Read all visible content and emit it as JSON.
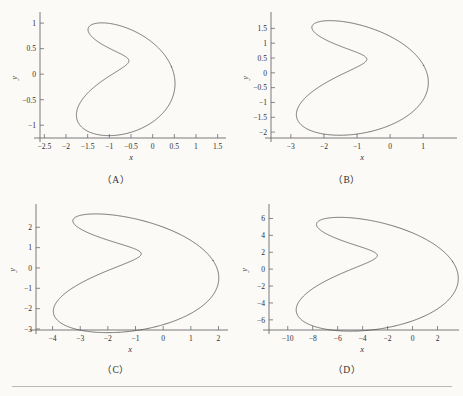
{
  "figure": {
    "background": "#fbfaf7",
    "curve_color": "#4a4a4a",
    "axis_color": "#6b6b6b",
    "rule_color": "#b9b9b9"
  },
  "panels": [
    {
      "id": "A",
      "caption": "（A）",
      "xlabel": "x",
      "ylabel": "y",
      "xticks": [
        "-2.5",
        "-2.0",
        "-1.5",
        "-1.0",
        "-0.5",
        "0.0",
        "0.5",
        "1.0",
        "1.5"
      ],
      "yticks": [
        "-1.0",
        "-0.5",
        "0.0",
        "0.5",
        "1.0"
      ]
    },
    {
      "id": "B",
      "caption": "（B）",
      "xlabel": "x",
      "ylabel": "y",
      "xticks": [
        "-3",
        "-2",
        "-1",
        "0",
        "1"
      ],
      "yticks": [
        "-2.0",
        "-1.5",
        "-1.0",
        "-0.5",
        "0.0",
        "0.5",
        "1.0",
        "1.5"
      ]
    },
    {
      "id": "C",
      "caption": "（C）",
      "xlabel": "x",
      "ylabel": "y",
      "xticks": [
        "-4",
        "-3",
        "-2",
        "-1",
        "0",
        "1",
        "2"
      ],
      "yticks": [
        "-3",
        "-2",
        "-1",
        "0",
        "1",
        "2"
      ]
    },
    {
      "id": "D",
      "caption": "（D）",
      "xlabel": "x",
      "ylabel": "y",
      "xticks": [
        "-10",
        "-8",
        "-6",
        "-4",
        "-2",
        "0",
        "2"
      ],
      "yticks": [
        "-6",
        "-4",
        "-2",
        "0",
        "2",
        "4",
        "6"
      ]
    }
  ],
  "chart_data": [
    {
      "type": "line",
      "title": "（A）",
      "xlabel": "x",
      "ylabel": "y",
      "grid": false,
      "legend": "none",
      "xlim": [
        -2.6,
        1.6
      ],
      "ylim": [
        -1.25,
        1.1
      ],
      "xticks": [
        -2.5,
        -2.0,
        -1.5,
        -1.0,
        -0.5,
        0.0,
        0.5,
        1.0,
        1.5
      ],
      "yticks": [
        -1.0,
        -0.5,
        0.0,
        0.5,
        1.0
      ],
      "series": [
        {
          "name": "curve-A",
          "description": "closed parametric rose/epitrochoid curve, 3 outer lobes with inner self-intersection loops",
          "parametric": {
            "t_range": [
              0,
              6.283185307179586
            ],
            "x": "0.55*cos(t) - 0.80 + 0.78*cos(2*t + 0.5)",
            "y": "0.98*sin(t) + 0.30*sin(2*t + 0.5)",
            "samples": 800
          },
          "xrange": [
            -2.35,
            1.35
          ],
          "yrange": [
            -1.15,
            1.0
          ]
        }
      ]
    },
    {
      "type": "line",
      "title": "（B）",
      "xlabel": "x",
      "ylabel": "y",
      "grid": false,
      "legend": "none",
      "xlim": [
        -3.6,
        1.9
      ],
      "ylim": [
        -2.2,
        1.85
      ],
      "xticks": [
        -3,
        -2,
        -1,
        0,
        1
      ],
      "yticks": [
        -2.0,
        -1.5,
        -1.0,
        -0.5,
        0.0,
        0.5,
        1.0,
        1.5
      ],
      "series": [
        {
          "name": "curve-B",
          "description": "same family as A, scaled ~1.75x",
          "parametric": {
            "t_range": [
              0,
              6.283185307179586
            ],
            "x": "0.96*cos(t) - 1.15 + 1.37*cos(2*t + 0.5)",
            "y": "1.72*sin(t) + 0.52*sin(2*t + 0.5)",
            "samples": 800
          },
          "xrange": [
            -3.3,
            1.65
          ],
          "yrange": [
            -2.0,
            1.78
          ]
        }
      ]
    },
    {
      "type": "line",
      "title": "（C）",
      "xlabel": "x",
      "ylabel": "y",
      "grid": false,
      "legend": "none",
      "xlim": [
        -4.6,
        2.2
      ],
      "ylim": [
        -3.05,
        2.85
      ],
      "xticks": [
        -4,
        -3,
        -2,
        -1,
        0,
        1,
        2
      ],
      "yticks": [
        -3,
        -2,
        -1,
        0,
        1,
        2
      ],
      "series": [
        {
          "name": "curve-C",
          "description": "same family as A, scaled ~2.7x",
          "parametric": {
            "t_range": [
              0,
              6.283185307179586
            ],
            "x": "1.45*cos(t) - 1.45 + 2.05*cos(2*t + 0.5)",
            "y": "2.60*sin(t) + 0.78*sin(2*t + 0.5)",
            "samples": 800
          },
          "xrange": [
            -4.35,
            2.1
          ],
          "yrange": [
            -2.85,
            2.7
          ]
        }
      ]
    },
    {
      "type": "line",
      "title": "（D）",
      "xlabel": "x",
      "ylabel": "y",
      "grid": false,
      "legend": "none",
      "xlim": [
        -11.5,
        3.4
      ],
      "ylim": [
        -7.2,
        7.0
      ],
      "xticks": [
        -10,
        -8,
        -6,
        -4,
        -2,
        0,
        2
      ],
      "yticks": [
        -6,
        -4,
        -2,
        0,
        2,
        4,
        6
      ],
      "series": [
        {
          "name": "curve-D",
          "description": "same family as A, scaled ~6.2x, elongated horizontally",
          "parametric": {
            "t_range": [
              0,
              6.283185307179586
            ],
            "x": "3.35*cos(t) - 3.90 + 4.30*cos(2*t + 0.5)",
            "y": "6.00*sin(t) + 1.80*sin(2*t + 0.5)",
            "samples": 800
          },
          "xrange": [
            -10.8,
            3.0
          ],
          "yrange": [
            -6.5,
            6.4
          ]
        }
      ]
    }
  ]
}
